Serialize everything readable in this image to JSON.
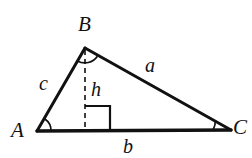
{
  "figure": {
    "kind": "geometry-diagram",
    "shape": "triangle",
    "background_color": "#ffffff",
    "stroke_color": "#111111",
    "vertices": [
      {
        "name": "A",
        "label": "A",
        "x": 37,
        "y": 131
      },
      {
        "name": "B",
        "label": "B",
        "x": 85,
        "y": 48
      },
      {
        "name": "C",
        "label": "C",
        "x": 231,
        "y": 130
      }
    ],
    "sides": [
      {
        "name": "a",
        "label": "a",
        "between": "B-C"
      },
      {
        "name": "b",
        "label": "b",
        "between": "A-C"
      },
      {
        "name": "c",
        "label": "c",
        "between": "A-B"
      }
    ],
    "altitude": {
      "label": "h",
      "from_vertex": "B",
      "foot_x": 85,
      "foot_y": 131,
      "style": "dashed",
      "right_angle_marked": true
    },
    "angle_marks": [
      {
        "at": "A",
        "style": "arc"
      },
      {
        "at": "B",
        "style": "arc"
      },
      {
        "at": "C",
        "style": "arc"
      }
    ]
  }
}
